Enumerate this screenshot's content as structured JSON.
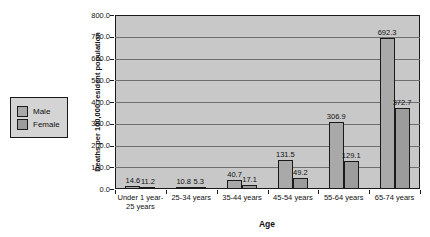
{
  "chart_data": {
    "type": "bar",
    "title": "",
    "xlabel": "Age",
    "ylabel": "Deaths per 100,000 resident population",
    "ylim": [
      0,
      800
    ],
    "ytick_step": 100,
    "ytick_labels": [
      "800.0",
      "700.0",
      "600.0",
      "500.0",
      "400.0",
      "300.0",
      "200.0",
      "100.0",
      "0.0"
    ],
    "grid": true,
    "legend_position": "left",
    "categories": [
      "Under 1 year-\n25 years",
      "25-34 years",
      "35-44 years",
      "45-54 years",
      "55-64 years",
      "65-74 years"
    ],
    "series": [
      {
        "name": "Male",
        "color": "#a9a9a9",
        "values": [
          14.6,
          10.8,
          40.7,
          131.5,
          306.9,
          692.3
        ]
      },
      {
        "name": "Female",
        "color": "#9c9c9c",
        "values": [
          11.2,
          5.3,
          17.1,
          49.2,
          129.1,
          372.7
        ]
      }
    ]
  },
  "colors": {
    "plot_background": "#c8c8c8",
    "gridline": "#6e6e6e",
    "axis": "#1a1a1a",
    "legend_background": "#d4d4d4",
    "text": "#111111"
  }
}
